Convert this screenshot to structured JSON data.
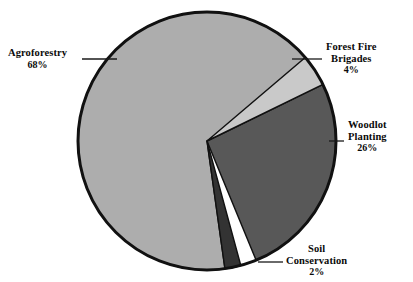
{
  "chart_data": {
    "type": "pie",
    "title": "",
    "subtitle": "",
    "xlabel": "",
    "ylabel": "",
    "legend_position": "callout-labels",
    "grid": false,
    "unit": "%",
    "total": 100,
    "categories": [
      "Agroforestry",
      "Woodlot Planting",
      "Forest Fire Brigades",
      "Soil Conservation"
    ],
    "values": [
      68,
      26,
      4,
      2
    ],
    "slices": [
      {
        "label": "Agroforestry",
        "value": 68,
        "value_text": "68%",
        "color": "#adadad",
        "start_angle": 82,
        "end_angle": 326.8
      },
      {
        "label": "Woodlot Planting",
        "value": 26,
        "value_text": "26%",
        "color": "#585858",
        "start_angle": -26,
        "end_angle": 67.6
      },
      {
        "label": "Forest Fire Brigades",
        "value": 4,
        "value_text": "4%",
        "color": "#c9c9c9",
        "start_angle": -40.4,
        "end_angle": -26
      },
      {
        "label": "Soil Conservation",
        "value": 2,
        "value_text": "2%",
        "color": "#333333",
        "start_angle": 74.8,
        "end_angle": 82
      }
    ],
    "geometry": {
      "center_x": 207,
      "center_y": 141,
      "radius": 129,
      "outline_color": "#111111",
      "outline_width": 3
    }
  },
  "labels": {
    "agroforestry": {
      "name": "Agroforestry",
      "percent": "68%"
    },
    "forest_fire_brigades": {
      "line1": "Forest Fire",
      "line2": "Brigades",
      "percent": "4%"
    },
    "woodlot_planting": {
      "line1": "Woodlot",
      "line2": "Planting",
      "percent": "26%"
    },
    "soil_conservation": {
      "line1": "Soil",
      "line2": "Conservation",
      "percent": "2%"
    }
  }
}
